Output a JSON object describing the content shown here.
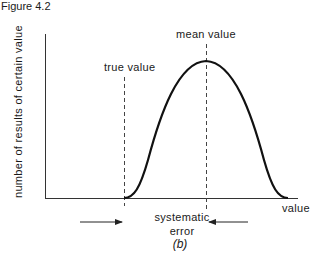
{
  "figure": {
    "title": "Figure 4.2",
    "subfigure_label": "(b)"
  },
  "diagram": {
    "y_axis_label": "number of results of certain value",
    "x_axis_label": "value",
    "annotations": {
      "true_value": "true value",
      "mean_value": "mean value",
      "systematic_error_line1": "systematic",
      "systematic_error_line2": "error"
    },
    "curve": {
      "type": "bell",
      "start_x": "true value",
      "peak_x": "mean value"
    },
    "colors": {
      "line": "#1a1a1a",
      "axis": "#333333",
      "dashed": "#444444"
    }
  }
}
